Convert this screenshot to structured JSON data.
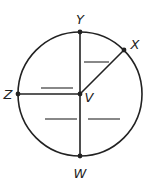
{
  "diagram": {
    "type": "circle-geometry",
    "center": {
      "label": "V",
      "x": 80,
      "y": 94
    },
    "radius": 62,
    "points": [
      {
        "label": "Y",
        "x": 80,
        "y": 32,
        "label_x": 80,
        "label_y": 24
      },
      {
        "label": "X",
        "x": 124,
        "y": 50,
        "label_x": 135,
        "label_y": 49
      },
      {
        "label": "Z",
        "x": 18,
        "y": 94,
        "label_x": 8,
        "label_y": 99
      },
      {
        "label": "V",
        "x": 80,
        "y": 94,
        "label_x": 89,
        "label_y": 102
      },
      {
        "label": "W",
        "x": 80,
        "y": 156,
        "label_x": 80,
        "label_y": 178
      }
    ],
    "segments": [
      {
        "from": "Y",
        "to": "W"
      },
      {
        "from": "Z",
        "to": "V"
      },
      {
        "from": "V",
        "to": "X"
      }
    ],
    "blank_lines": [
      {
        "name": "blank-angle-YVX",
        "x1": 84,
        "y1": 62,
        "x2": 109,
        "y2": 62
      },
      {
        "name": "blank-angle-ZVY",
        "x1": 41,
        "y1": 88,
        "x2": 73,
        "y2": 88
      },
      {
        "name": "blank-angle-ZVW",
        "x1": 45,
        "y1": 119,
        "x2": 77,
        "y2": 119
      },
      {
        "name": "blank-angle-WVX",
        "x1": 88,
        "y1": 119,
        "x2": 120,
        "y2": 119
      }
    ],
    "colors": {
      "stroke": "#222222",
      "blank": "#555555"
    }
  }
}
